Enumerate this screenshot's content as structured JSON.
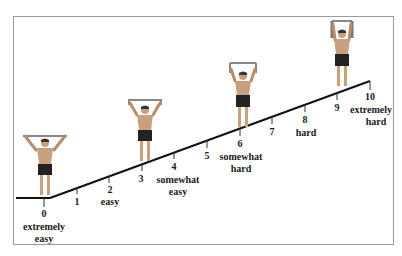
{
  "diagram": {
    "type": "perceived-exertion-scale",
    "colors": {
      "line": "#111111",
      "frame": "#9a9a9a",
      "skin": "#c9a07e",
      "shorts": "#222222",
      "band": "#7a7a7a"
    },
    "levels": [
      {
        "value": "0",
        "descriptor_line1": "extremely",
        "descriptor_line2": "easy"
      },
      {
        "value": "1",
        "descriptor_line1": "",
        "descriptor_line2": ""
      },
      {
        "value": "2",
        "descriptor_line1": "easy",
        "descriptor_line2": ""
      },
      {
        "value": "3",
        "descriptor_line1": "",
        "descriptor_line2": ""
      },
      {
        "value": "4",
        "descriptor_line1": "somewhat",
        "descriptor_line2": "easy"
      },
      {
        "value": "5",
        "descriptor_line1": "",
        "descriptor_line2": ""
      },
      {
        "value": "6",
        "descriptor_line1": "somewhat",
        "descriptor_line2": "hard"
      },
      {
        "value": "7",
        "descriptor_line1": "",
        "descriptor_line2": ""
      },
      {
        "value": "8",
        "descriptor_line1": "hard",
        "descriptor_line2": ""
      },
      {
        "value": "9",
        "descriptor_line1": "",
        "descriptor_line2": ""
      },
      {
        "value": "10",
        "descriptor_line1": "extremely",
        "descriptor_line2": "hard"
      }
    ],
    "figures": [
      {
        "name": "figure-level-0",
        "pose": "band-stretched-wide"
      },
      {
        "name": "figure-level-3",
        "pose": "band-overhead"
      },
      {
        "name": "figure-level-6",
        "pose": "band-overhead-narrow"
      },
      {
        "name": "figure-level-9",
        "pose": "band-overhead-vertical"
      }
    ]
  }
}
